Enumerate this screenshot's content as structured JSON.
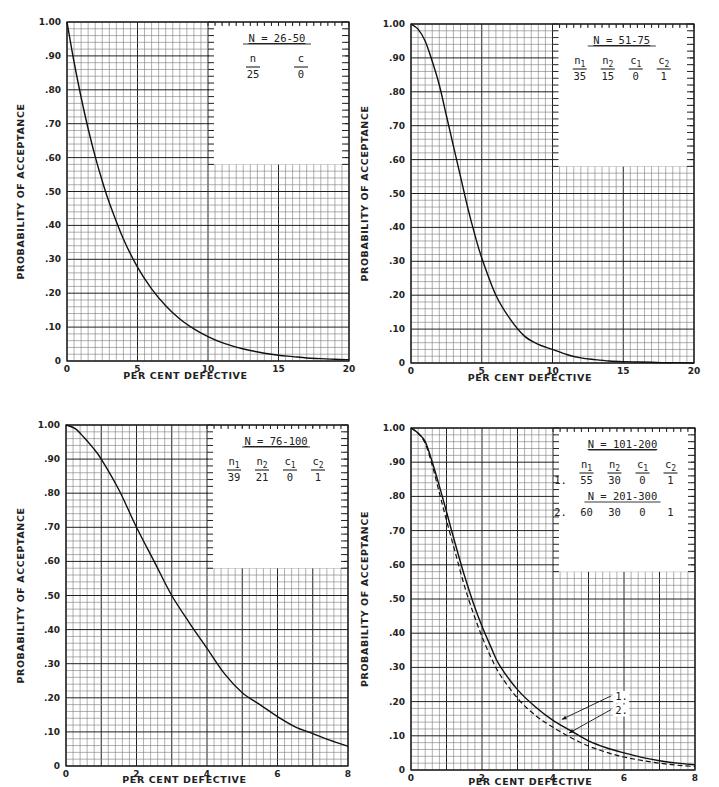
{
  "chart_data": [
    {
      "id": "chart-n-26-50",
      "type": "line",
      "title": "N = 26-50",
      "xlabel": "PER CENT DEFECTIVE",
      "ylabel": "PROBABILITY OF ACCEPTANCE",
      "xlim": [
        0,
        20
      ],
      "ylim": [
        0,
        1.0
      ],
      "x_ticks": [
        0,
        5,
        10,
        15,
        20
      ],
      "x_tick_labels": [
        "0",
        "5",
        "10",
        "15",
        "20"
      ],
      "x_major_step": 5,
      "x_minor_step": 0.5,
      "y_ticks": [
        0,
        0.1,
        0.2,
        0.3,
        0.4,
        0.5,
        0.6,
        0.7,
        0.8,
        0.9,
        1.0
      ],
      "y_tick_labels": [
        "0",
        ".10",
        ".20",
        ".30",
        ".40",
        ".50",
        ".60",
        ".70",
        ".80",
        ".90",
        "1.00"
      ],
      "y_major_step": 0.1,
      "y_minor_step": 0.02,
      "grid": true,
      "legend_box": {
        "x_from": 10,
        "y_from": 0.58,
        "heading": "N = 26-50",
        "columns": [
          "n",
          "c"
        ],
        "rows": [
          [
            "25",
            "0"
          ]
        ]
      },
      "series": [
        {
          "name": "n=25, c=0",
          "style": "solid",
          "x": [
            0,
            0.5,
            1,
            1.5,
            2,
            2.5,
            3,
            4,
            5,
            6,
            7,
            8,
            9,
            10,
            11,
            12,
            13,
            14,
            15,
            16,
            17,
            18,
            19,
            20
          ],
          "y": [
            1.0,
            0.882,
            0.778,
            0.685,
            0.603,
            0.531,
            0.467,
            0.36,
            0.277,
            0.213,
            0.163,
            0.124,
            0.095,
            0.072,
            0.054,
            0.041,
            0.031,
            0.023,
            0.017,
            0.013,
            0.009,
            0.007,
            0.005,
            0.004
          ]
        }
      ]
    },
    {
      "id": "chart-n-51-75",
      "type": "line",
      "title": "N = 51-75",
      "xlabel": "PER CENT DEFECTIVE",
      "ylabel": "PROBABILITY OF ACCEPTANCE",
      "xlim": [
        0,
        20
      ],
      "ylim": [
        0,
        1.0
      ],
      "x_ticks": [
        0,
        5,
        10,
        15,
        20
      ],
      "x_tick_labels": [
        "0",
        "5",
        "10",
        "15",
        "20"
      ],
      "x_major_step": 5,
      "x_minor_step": 0.5,
      "y_ticks": [
        0,
        0.1,
        0.2,
        0.3,
        0.4,
        0.5,
        0.6,
        0.7,
        0.8,
        0.9,
        1.0
      ],
      "y_tick_labels": [
        "0",
        ".10",
        ".20",
        ".30",
        ".40",
        ".50",
        ".60",
        ".70",
        ".80",
        ".90",
        "1.00"
      ],
      "y_major_step": 0.1,
      "y_minor_step": 0.02,
      "grid": true,
      "legend_box": {
        "x_from": 10,
        "y_from": 0.58,
        "heading": "N = 51-75",
        "columns": [
          "n1",
          "n2",
          "c1",
          "c2"
        ],
        "rows": [
          [
            "35",
            "15",
            "0",
            "1"
          ]
        ]
      },
      "series": [
        {
          "name": "n1=35, n2=15, c1=0, c2=1",
          "style": "solid",
          "x": [
            0,
            0.5,
            1,
            1.5,
            2,
            2.5,
            3,
            3.5,
            4,
            4.5,
            5,
            6,
            7,
            8,
            9,
            10,
            11,
            12,
            13,
            14,
            15,
            16,
            17,
            18,
            19,
            20
          ],
          "y": [
            1.0,
            0.985,
            0.95,
            0.89,
            0.82,
            0.73,
            0.64,
            0.55,
            0.46,
            0.38,
            0.31,
            0.2,
            0.13,
            0.08,
            0.055,
            0.04,
            0.025,
            0.015,
            0.01,
            0.006,
            0.004,
            0.003,
            0.002,
            0.001,
            0.001,
            0.0
          ]
        }
      ]
    },
    {
      "id": "chart-n-76-100",
      "type": "line",
      "title": "N = 76-100",
      "xlabel": "PER CENT DEFECTIVE",
      "ylabel": "PROBABILITY OF ACCEPTANCE",
      "xlim": [
        0,
        8
      ],
      "ylim": [
        0,
        1.0
      ],
      "x_ticks": [
        0,
        2,
        4,
        6,
        8
      ],
      "x_tick_labels": [
        "0",
        "2",
        "4",
        "6",
        "8"
      ],
      "x_major_step": 1,
      "x_minor_step": 0.2,
      "y_ticks": [
        0,
        0.1,
        0.2,
        0.3,
        0.4,
        0.5,
        0.6,
        0.7,
        0.8,
        0.9,
        1.0
      ],
      "y_tick_labels": [
        "0",
        ".10",
        ".20",
        ".30",
        ".40",
        ".50",
        ".60",
        ".70",
        ".80",
        ".90",
        "1.00"
      ],
      "y_major_step": 0.1,
      "y_minor_step": 0.02,
      "grid": true,
      "legend_box": {
        "x_from": 4,
        "y_from": 0.58,
        "heading": "N = 76-100",
        "columns": [
          "n1",
          "n2",
          "c1",
          "c2"
        ],
        "rows": [
          [
            "39",
            "21",
            "0",
            "1"
          ]
        ]
      },
      "series": [
        {
          "name": "n1=39, n2=21, c1=0, c2=1",
          "style": "solid",
          "x": [
            0,
            0.25,
            0.5,
            0.75,
            1,
            1.5,
            2,
            2.5,
            3,
            3.5,
            4,
            4.5,
            5,
            5.5,
            6,
            6.5,
            7,
            7.5,
            8
          ],
          "y": [
            1.0,
            0.99,
            0.965,
            0.935,
            0.9,
            0.81,
            0.7,
            0.6,
            0.5,
            0.42,
            0.345,
            0.27,
            0.215,
            0.18,
            0.145,
            0.115,
            0.095,
            0.075,
            0.058
          ]
        }
      ]
    },
    {
      "id": "chart-n-101-300",
      "type": "line",
      "title": "N = 101-200 / N = 201-300",
      "xlabel": "PER CENT DEFECTIVE",
      "ylabel": "PROBABILITY OF ACCEPTANCE",
      "xlim": [
        0,
        8
      ],
      "ylim": [
        0,
        1.0
      ],
      "x_ticks": [
        0,
        2,
        4,
        6,
        8
      ],
      "x_tick_labels": [
        "0",
        "2",
        "4",
        "6",
        "8"
      ],
      "x_major_step": 1,
      "x_minor_step": 0.2,
      "y_ticks": [
        0,
        0.1,
        0.2,
        0.3,
        0.4,
        0.5,
        0.6,
        0.7,
        0.8,
        0.9,
        1.0
      ],
      "y_tick_labels": [
        "0",
        ".10",
        ".20",
        ".30",
        ".40",
        ".50",
        ".60",
        ".70",
        ".80",
        ".90",
        "1.00"
      ],
      "y_major_step": 0.1,
      "y_minor_step": 0.02,
      "grid": true,
      "legend_box": {
        "x_from": 4,
        "y_from": 0.58,
        "heading": "N = 101-200",
        "heading2": "N = 201-300",
        "columns": [
          "n1",
          "n2",
          "c1",
          "c2"
        ],
        "rows": [
          [
            "1.",
            "55",
            "30",
            "0",
            "1"
          ],
          [
            "2.",
            "60",
            "30",
            "0",
            "1"
          ]
        ]
      },
      "annotations": [
        {
          "label": "1.",
          "label_x": 5.75,
          "label_y": 0.205,
          "arrow_to_x": 4.25,
          "arrow_to_y": 0.148
        },
        {
          "label": "2.",
          "label_x": 5.75,
          "label_y": 0.165,
          "arrow_to_x": 4.45,
          "arrow_to_y": 0.108
        }
      ],
      "series": [
        {
          "name": "1. n1=55, n2=30, c1=0, c2=1 (N = 101-200)",
          "style": "solid",
          "x": [
            0,
            0.2,
            0.4,
            0.6,
            0.8,
            1.0,
            1.25,
            1.5,
            1.75,
            2.0,
            2.25,
            2.5,
            3.0,
            3.5,
            4.0,
            4.5,
            5.0,
            5.5,
            6.0,
            6.5,
            7.0,
            7.5,
            8.0
          ],
          "y": [
            1.0,
            0.985,
            0.96,
            0.9,
            0.83,
            0.755,
            0.66,
            0.57,
            0.49,
            0.42,
            0.36,
            0.305,
            0.235,
            0.185,
            0.145,
            0.115,
            0.085,
            0.065,
            0.05,
            0.037,
            0.027,
            0.02,
            0.015
          ]
        },
        {
          "name": "2. n1=60, n2=30, c1=0, c2=1 (N = 201-300)",
          "style": "dashed",
          "x": [
            0,
            0.2,
            0.4,
            0.6,
            0.8,
            1.0,
            1.25,
            1.5,
            1.75,
            2.0,
            2.25,
            2.5,
            3.0,
            3.5,
            4.0,
            4.5,
            5.0,
            5.5,
            6.0,
            6.5,
            7.0,
            7.5,
            8.0
          ],
          "y": [
            1.0,
            0.985,
            0.955,
            0.89,
            0.81,
            0.73,
            0.635,
            0.54,
            0.46,
            0.39,
            0.33,
            0.28,
            0.21,
            0.16,
            0.125,
            0.095,
            0.07,
            0.052,
            0.038,
            0.028,
            0.02,
            0.014,
            0.01
          ]
        }
      ]
    }
  ],
  "layout": [
    {
      "left": 67,
      "top": 22,
      "width": 282,
      "height": 339,
      "ylabel_x": 24,
      "xlabel_y": 381
    },
    {
      "left": 411,
      "top": 24,
      "width": 283,
      "height": 339,
      "ylabel_x": 368,
      "xlabel_y": 383
    },
    {
      "left": 66,
      "top": 425,
      "width": 282,
      "height": 341,
      "ylabel_x": 24,
      "xlabel_y": 785
    },
    {
      "left": 411,
      "top": 428,
      "width": 284,
      "height": 342,
      "ylabel_x": 368,
      "xlabel_y": 787
    }
  ]
}
